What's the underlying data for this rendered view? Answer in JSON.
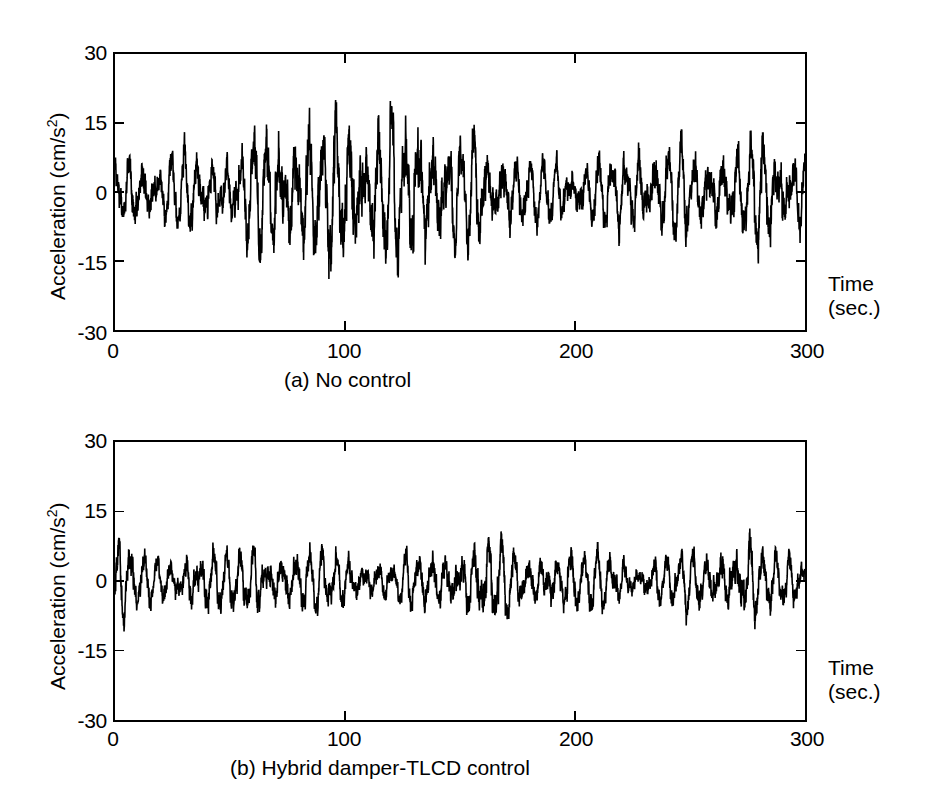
{
  "figure": {
    "background_color": "#ffffff",
    "line_color": "#000000"
  },
  "panels": [
    {
      "id": "a",
      "caption": "(a) No control",
      "ylabel_text": "Acceleration (cm/s",
      "ylabel_sup": "2",
      "ylabel_tail": ")",
      "time_label_line1": "Time",
      "time_label_line2": "(sec.)",
      "yticks": [
        "30",
        "15",
        "0",
        "-15",
        "-30"
      ],
      "xticks": [
        "0",
        "100",
        "200",
        "300"
      ]
    },
    {
      "id": "b",
      "caption": "(b) Hybrid damper-TLCD control",
      "ylabel_text": "Acceleration (cm/s",
      "ylabel_sup": "2",
      "ylabel_tail": ")",
      "time_label_line1": "Time",
      "time_label_line2": "(sec.)",
      "yticks": [
        "30",
        "15",
        "0",
        "-15",
        "-30"
      ],
      "xticks": [
        "0",
        "100",
        "200",
        "300"
      ]
    }
  ],
  "chart_data": [
    {
      "type": "line",
      "id": "a",
      "title": "(a) No control",
      "xlabel": "Time (sec.)",
      "ylabel": "Acceleration (cm/s^2)",
      "xlim": [
        0,
        300
      ],
      "ylim": [
        -30,
        30
      ],
      "xticks": [
        0,
        100,
        200,
        300
      ],
      "yticks": [
        -30,
        -15,
        0,
        15,
        30
      ],
      "grid": false,
      "legend": "none",
      "description": "Uncontrolled structural acceleration response time history; dense high-frequency oscillation with slowly varying amplitude envelope that grows from about 12 cm/s^2 near t=0 to a maximum near 29 cm/s^2 around t=95 s, then decays toward about 10 cm/s^2 near t=200 s before rising again to about 18 cm/s^2 near t=280 s.",
      "dominant_period_sec": 4.2,
      "envelope": {
        "x": [
          0,
          10,
          20,
          30,
          40,
          50,
          60,
          70,
          80,
          90,
          95,
          100,
          110,
          120,
          130,
          140,
          150,
          160,
          170,
          180,
          190,
          200,
          210,
          220,
          230,
          240,
          250,
          260,
          270,
          280,
          290,
          300
        ],
        "amplitude": [
          12,
          13,
          11,
          14,
          13,
          12,
          20,
          21,
          22,
          24,
          29,
          23,
          22,
          24,
          26,
          22,
          19,
          17,
          15,
          13,
          11,
          10,
          12,
          14,
          15,
          16,
          15,
          14,
          16,
          18,
          16,
          12
        ]
      },
      "peak_positive": 29,
      "peak_negative": -28,
      "peak_positive_time": 95,
      "peak_negative_time": 132
    },
    {
      "type": "line",
      "id": "b",
      "title": "(b) Hybrid damper-TLCD control",
      "xlabel": "Time (sec.)",
      "ylabel": "Acceleration (cm/s^2)",
      "xlim": [
        0,
        300
      ],
      "ylim": [
        -30,
        30
      ],
      "xticks": [
        0,
        100,
        200,
        300
      ],
      "yticks": [
        -30,
        -15,
        0,
        15,
        30
      ],
      "grid": false,
      "legend": "none",
      "description": "Controlled structural acceleration response with hybrid damper-TLCD; amplitude strongly reduced and roughly stationary, mostly within +/-10 cm/s^2 with occasional peaks near 14 cm/s^2 at t=2 s, t=160 s and t=275 s, and a minimum near -16 cm/s^2 around t=170 s.",
      "dominant_period_sec": 4.2,
      "envelope": {
        "x": [
          0,
          10,
          20,
          30,
          40,
          50,
          60,
          70,
          80,
          90,
          100,
          110,
          120,
          130,
          140,
          150,
          160,
          170,
          180,
          190,
          200,
          210,
          220,
          230,
          240,
          250,
          260,
          270,
          280,
          290,
          300
        ],
        "amplitude": [
          14,
          10,
          8,
          9,
          11,
          10,
          11,
          10,
          11,
          10,
          9,
          7,
          7,
          9,
          10,
          11,
          14,
          13,
          8,
          9,
          12,
          10,
          8,
          7,
          9,
          10,
          11,
          14,
          12,
          9,
          8
        ]
      },
      "peak_positive": 14,
      "peak_negative": -16,
      "peak_positive_time": 2,
      "peak_negative_time": 170
    }
  ]
}
